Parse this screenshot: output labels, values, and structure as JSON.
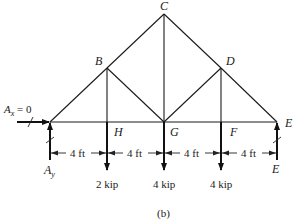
{
  "figure": {
    "caption": "(b)",
    "nodes": [
      {
        "id": "A",
        "label": "",
        "x": 50,
        "y": 122
      },
      {
        "id": "B",
        "label": "B",
        "x": 107,
        "y": 68
      },
      {
        "id": "C",
        "label": "C",
        "x": 164,
        "y": 14
      },
      {
        "id": "D",
        "label": "D",
        "x": 221,
        "y": 68
      },
      {
        "id": "E",
        "label": "E",
        "x": 277,
        "y": 122
      },
      {
        "id": "H",
        "label": "H",
        "x": 107,
        "y": 122
      },
      {
        "id": "G",
        "label": "G",
        "x": 164,
        "y": 122
      },
      {
        "id": "F",
        "label": "F",
        "x": 221,
        "y": 122
      }
    ],
    "members": [
      [
        "A",
        "B"
      ],
      [
        "B",
        "C"
      ],
      [
        "C",
        "D"
      ],
      [
        "D",
        "E"
      ],
      [
        "A",
        "H"
      ],
      [
        "H",
        "G"
      ],
      [
        "G",
        "F"
      ],
      [
        "F",
        "E"
      ],
      [
        "B",
        "H"
      ],
      [
        "C",
        "G"
      ],
      [
        "D",
        "F"
      ],
      [
        "B",
        "G"
      ],
      [
        "D",
        "G"
      ]
    ],
    "reactions": {
      "ax_label_main": "A",
      "ax_label_sub": "x",
      "ax_value": " = 0",
      "ay_label_main": "A",
      "ay_label_sub": "y",
      "e_reaction_label": "E"
    },
    "loads": [
      {
        "node": "H",
        "label": "2 kip",
        "magnitude_kip": 2
      },
      {
        "node": "G",
        "label": "4 kip",
        "magnitude_kip": 4
      },
      {
        "node": "F",
        "label": "4 kip",
        "magnitude_kip": 4
      }
    ],
    "dimensions": [
      {
        "from": "A",
        "to": "H",
        "label": "4 ft"
      },
      {
        "from": "H",
        "to": "G",
        "label": "4 ft"
      },
      {
        "from": "G",
        "to": "F",
        "label": "4 ft"
      },
      {
        "from": "F",
        "to": "E",
        "label": "4 ft"
      }
    ]
  }
}
